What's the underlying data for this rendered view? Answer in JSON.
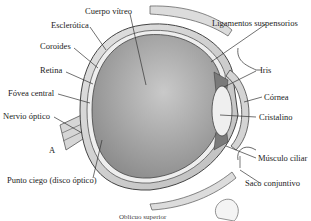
{
  "diagram": {
    "type": "anatomical cross-section",
    "labels": {
      "cuerpo_vitreo": "Cuerpo vítreo",
      "esclerotica": "Esclerótica",
      "coroides": "Coroides",
      "retina": "Retina",
      "fovea_central": "Fóvea central",
      "nervio_optico": "Nervio óptico",
      "a_marker": "A",
      "punto_ciego": "Punto ciego (disco óptico)",
      "ligamentos": "Ligamentos suspensorios",
      "iris": "Iris",
      "cornea": "Córnea",
      "cristalino": "Cristalino",
      "musculo_ciliar": "Músculo ciliar",
      "saco_conjuntivo": "Saco conjuntivo",
      "oblicuo_cut": "Oblicuo superior"
    },
    "colors": {
      "sclera": "#d9d9d9",
      "vitreous_dark": "#8a8a8a",
      "vitreous_light": "#c8c8c8",
      "lens": "#ececec",
      "line": "#333333"
    }
  }
}
